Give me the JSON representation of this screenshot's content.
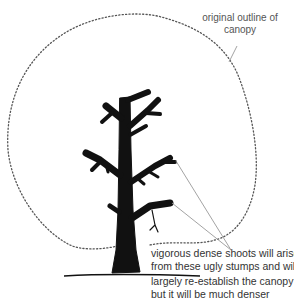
{
  "figure": {
    "annotations": {
      "canopy_outline": [
        "original outline of",
        "canopy"
      ],
      "shoots": [
        "vigorous dense shoots will arise",
        "from these ugly stumps and will",
        "largely re-establish the canopy",
        "but it will  be much denser"
      ]
    },
    "colors": {
      "tree": "#111111",
      "outline": "#555555",
      "leader_lines": "#999999",
      "text": "#333333"
    }
  }
}
